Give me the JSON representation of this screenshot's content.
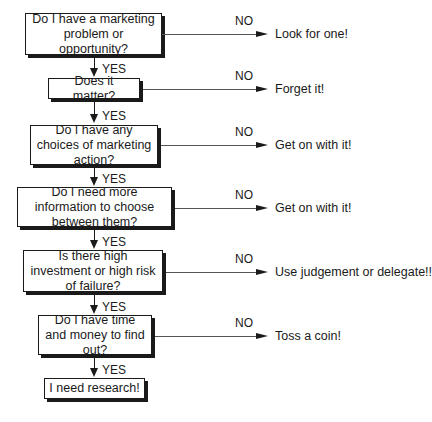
{
  "flowchart": {
    "yes_label": "YES",
    "no_label": "NO",
    "steps": [
      {
        "question": "Do I have a marketing problem or opportunity?",
        "no_result": "Look for one!"
      },
      {
        "question": "Does it matter?",
        "no_result": "Forget it!"
      },
      {
        "question": "Do I have any choices of marketing action?",
        "no_result": "Get on with it!"
      },
      {
        "question": "Do I need more information to choose between them?",
        "no_result": "Get on with it!"
      },
      {
        "question": "Is there high investment or high risk of failure?",
        "no_result": "Use judgement or delegate!!"
      },
      {
        "question": "Do I have time and money to find out?",
        "no_result": "Toss a coin!"
      }
    ],
    "final": "I need research!"
  }
}
